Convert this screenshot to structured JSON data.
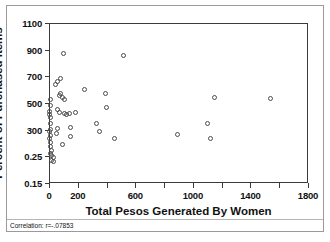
{
  "figure": {
    "xlabel": "Total Pesos Generated By Women",
    "ylabel": "Percent of Purchased Items",
    "footnote": "Correlation: r=-.07853"
  },
  "chart_data": {
    "type": "scatter",
    "title": "",
    "xlabel": "Total Pesos Generated By Women",
    "ylabel": "Percent of Purchased Items",
    "xlim": [
      0,
      1800
    ],
    "xticks": [
      0,
      200,
      600,
      1000,
      1400,
      1800
    ],
    "xtick_labels": [
      "0",
      "200",
      "600",
      "1000",
      "1400",
      "1800"
    ],
    "ytick_labels": [
      "1100",
      "900",
      "700",
      "500",
      "300",
      "0.25",
      "0.15"
    ],
    "ytick_values": [
      1100,
      900,
      700,
      500,
      300,
      125,
      15
    ],
    "ylim": [
      15,
      1100
    ],
    "grid": false,
    "legend": null,
    "marker": "open-circle",
    "annotations": [
      "Correlation: r=-.07853"
    ],
    "points": [
      {
        "x": 10,
        "y": 530
      },
      {
        "x": 8,
        "y": 480
      },
      {
        "x": 6,
        "y": 440
      },
      {
        "x": 5,
        "y": 415
      },
      {
        "x": 7,
        "y": 395
      },
      {
        "x": 12,
        "y": 350
      },
      {
        "x": 9,
        "y": 305
      },
      {
        "x": 6,
        "y": 285
      },
      {
        "x": 8,
        "y": 265
      },
      {
        "x": 5,
        "y": 240
      },
      {
        "x": 10,
        "y": 215
      },
      {
        "x": 7,
        "y": 190
      },
      {
        "x": 14,
        "y": 165
      },
      {
        "x": 9,
        "y": 145
      },
      {
        "x": 20,
        "y": 128
      },
      {
        "x": 32,
        "y": 122
      },
      {
        "x": 16,
        "y": 108
      },
      {
        "x": 30,
        "y": 104
      },
      {
        "x": 45,
        "y": 640
      },
      {
        "x": 62,
        "y": 665
      },
      {
        "x": 80,
        "y": 685
      },
      {
        "x": 100,
        "y": 875
      },
      {
        "x": 72,
        "y": 560
      },
      {
        "x": 78,
        "y": 575
      },
      {
        "x": 95,
        "y": 545
      },
      {
        "x": 110,
        "y": 530
      },
      {
        "x": 60,
        "y": 455
      },
      {
        "x": 75,
        "y": 430
      },
      {
        "x": 105,
        "y": 425
      },
      {
        "x": 125,
        "y": 415
      },
      {
        "x": 140,
        "y": 420
      },
      {
        "x": 60,
        "y": 310
      },
      {
        "x": 52,
        "y": 275
      },
      {
        "x": 150,
        "y": 315
      },
      {
        "x": 148,
        "y": 252
      },
      {
        "x": 95,
        "y": 205
      },
      {
        "x": 185,
        "y": 430
      },
      {
        "x": 245,
        "y": 600
      },
      {
        "x": 330,
        "y": 345
      },
      {
        "x": 350,
        "y": 290
      },
      {
        "x": 395,
        "y": 575
      },
      {
        "x": 400,
        "y": 470
      },
      {
        "x": 455,
        "y": 245
      },
      {
        "x": 520,
        "y": 855
      },
      {
        "x": 890,
        "y": 270
      },
      {
        "x": 1100,
        "y": 345
      },
      {
        "x": 1120,
        "y": 245
      },
      {
        "x": 1150,
        "y": 540
      },
      {
        "x": 1540,
        "y": 535
      }
    ]
  },
  "axis_pixels": {
    "left": 49,
    "top": 23,
    "width": 259,
    "height": 160
  }
}
